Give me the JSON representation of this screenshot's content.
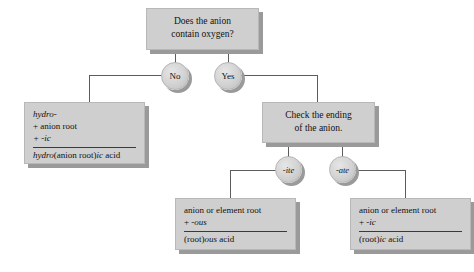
{
  "figure": {
    "background_color": "#ffffff",
    "box_fill_color": "#cfcfcf",
    "shadow_color": "#9a9a9a",
    "line_color": "#5c5c5c"
  },
  "nodes": {
    "question": {
      "line1": "Does the anion",
      "line2": "contain oxygen?"
    },
    "answer_no": {
      "label": "No"
    },
    "answer_yes": {
      "label": "Yes"
    },
    "hydro_rule": {
      "line1": "hydro-",
      "line2": "+ anion root",
      "line3": "+ -ic",
      "result_pre": "hydro",
      "result_mid": "(anion root)",
      "result_suffix": "ic",
      "result_post": " acid"
    },
    "check_ending": {
      "line1": "Check the ending",
      "line2": "of the anion."
    },
    "ending_ite": {
      "label": "-ite"
    },
    "ending_ate": {
      "label": "-ate"
    },
    "ous_rule": {
      "line1": "anion or element root",
      "line2_plus": "+ ",
      "line2_suffix": "-ous",
      "result_pre": "(root)",
      "result_suffix": "ous",
      "result_post": " acid"
    },
    "ic_rule": {
      "line1": "anion or element root",
      "line2_plus": "+ ",
      "line2_suffix": "-ic",
      "result_pre": "(root)",
      "result_suffix": "ic",
      "result_post": " acid"
    }
  }
}
